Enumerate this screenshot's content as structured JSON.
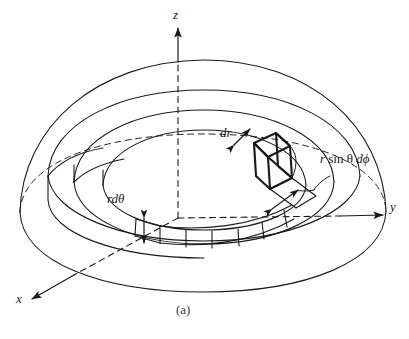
{
  "figure": {
    "caption": "(a)",
    "background_color": "#ffffff",
    "ink_color": "#1a1a1a"
  },
  "axes": [
    {
      "name": "z-axis",
      "label": "z",
      "direction": "up"
    },
    {
      "name": "y-axis",
      "label": "y",
      "direction": "right"
    },
    {
      "name": "x-axis",
      "label": "x",
      "direction": "down-left"
    }
  ],
  "annotations": [
    {
      "name": "dr",
      "label": "dr",
      "arrow": "double-headed-diagonal"
    },
    {
      "name": "r-d-theta",
      "label": "rdθ",
      "arrow": "double-headed-vertical"
    },
    {
      "name": "r-sin-theta-d-phi",
      "label": "r sin θ dϕ",
      "arrow": "double-headed-diagonal"
    }
  ],
  "labels": {
    "z": "z",
    "y": "y",
    "x": "x",
    "dr": "dr",
    "rdtheta": "rdθ",
    "rsinthetadphi_r": "r",
    "rsinthetadphi_sin": "sin",
    "rsinthetadphi_theta": "θ",
    "rsinthetadphi_d": "d",
    "rsinthetadphi_phi": "ϕ",
    "caption": "(a)"
  }
}
